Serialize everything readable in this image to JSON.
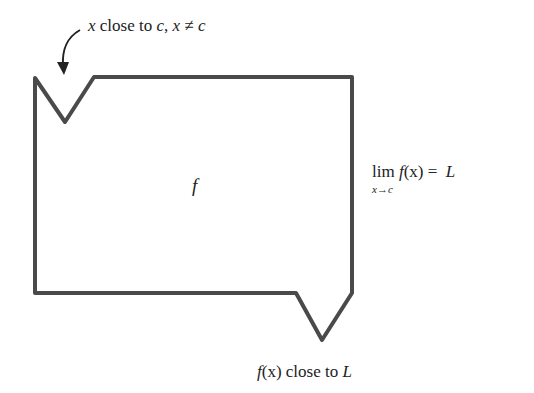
{
  "diagram": {
    "top_annotation": {
      "var": "x",
      "text1": " close to ",
      "c1": "c",
      "sep": ", ",
      "x2": "x",
      "neq": " ≠ ",
      "c2": "c"
    },
    "box_label": "f",
    "limit": {
      "lim": "lim",
      "func": "f",
      "arg": "(x)",
      "eq": " = ",
      "value": "L",
      "sub_var": "x",
      "sub_arrow": "→",
      "sub_target": "c"
    },
    "bottom_annotation": {
      "func": "f",
      "arg": "(x)",
      "text": " close to ",
      "value": "L"
    },
    "colors": {
      "outline": "#4a4a4a",
      "text": "#222222"
    }
  }
}
